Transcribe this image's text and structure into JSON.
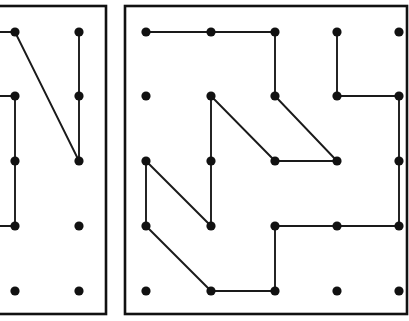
{
  "figure": {
    "canvas": {
      "width": 409,
      "height": 321
    },
    "background_color": "#ffffff",
    "peg_color": "#111111",
    "line_color": "#1a1a1a",
    "border_color": "#111111",
    "peg_radius": 4.6,
    "line_width": 1.9,
    "border_width": 2.6
  },
  "panels": [
    {
      "id": "left-panel",
      "label": "Left geoboard panel (cropped at left edge)",
      "frame": {
        "x": -40,
        "y": 6,
        "width": 146,
        "height": 308
      },
      "grid": {
        "columns_x": [
          15,
          79
        ],
        "rows_y": [
          32,
          96,
          161,
          226,
          291
        ],
        "spacing_x": 64,
        "spacing_y": 65
      },
      "pegs": [
        {
          "id": "L-c1-r1",
          "x": 15,
          "y": 32
        },
        {
          "id": "L-c2-r1",
          "x": 79,
          "y": 32
        },
        {
          "id": "L-c1-r2",
          "x": 15,
          "y": 96
        },
        {
          "id": "L-c2-r2",
          "x": 79,
          "y": 96
        },
        {
          "id": "L-c1-r3",
          "x": 15,
          "y": 161
        },
        {
          "id": "L-c2-r3",
          "x": 79,
          "y": 161
        },
        {
          "id": "L-c1-r4",
          "x": 15,
          "y": 226
        },
        {
          "id": "L-c2-r4",
          "x": 79,
          "y": 226
        },
        {
          "id": "L-c1-r5",
          "x": 15,
          "y": 291
        },
        {
          "id": "L-c2-r5",
          "x": 79,
          "y": 291
        }
      ],
      "segments": [
        {
          "id": "L-s1",
          "x1": -8,
          "y1": 32,
          "x2": 15,
          "y2": 32,
          "kind": "horizontal-clipped"
        },
        {
          "id": "L-s2",
          "x1": 15,
          "y1": 32,
          "x2": 79,
          "y2": 161,
          "kind": "diagonal"
        },
        {
          "id": "L-s3",
          "x1": 79,
          "y1": 32,
          "x2": 79,
          "y2": 161,
          "kind": "vertical"
        },
        {
          "id": "L-s4",
          "x1": -8,
          "y1": 96,
          "x2": 15,
          "y2": 96,
          "kind": "horizontal-clipped"
        },
        {
          "id": "L-s5",
          "x1": 15,
          "y1": 96,
          "x2": 15,
          "y2": 226,
          "kind": "vertical"
        },
        {
          "id": "L-s6",
          "x1": -8,
          "y1": 226,
          "x2": 15,
          "y2": 226,
          "kind": "horizontal-clipped"
        }
      ]
    },
    {
      "id": "right-panel",
      "label": "Right geoboard panel",
      "frame": {
        "x": 125,
        "y": 6,
        "width": 282,
        "height": 308
      },
      "grid": {
        "columns_x": [
          146,
          211,
          275,
          337,
          399
        ],
        "rows_y": [
          32,
          96,
          161,
          226,
          291
        ],
        "spacing_x": 64,
        "spacing_y": 65
      },
      "pegs": [
        {
          "id": "R-c1-r1",
          "x": 146,
          "y": 32
        },
        {
          "id": "R-c2-r1",
          "x": 211,
          "y": 32
        },
        {
          "id": "R-c3-r1",
          "x": 275,
          "y": 32
        },
        {
          "id": "R-c4-r1",
          "x": 337,
          "y": 32
        },
        {
          "id": "R-c5-r1",
          "x": 399,
          "y": 32
        },
        {
          "id": "R-c1-r2",
          "x": 146,
          "y": 96
        },
        {
          "id": "R-c2-r2",
          "x": 211,
          "y": 96
        },
        {
          "id": "R-c3-r2",
          "x": 275,
          "y": 96
        },
        {
          "id": "R-c4-r2",
          "x": 337,
          "y": 96
        },
        {
          "id": "R-c5-r2",
          "x": 399,
          "y": 96
        },
        {
          "id": "R-c1-r3",
          "x": 146,
          "y": 161
        },
        {
          "id": "R-c2-r3",
          "x": 211,
          "y": 161
        },
        {
          "id": "R-c3-r3",
          "x": 275,
          "y": 161
        },
        {
          "id": "R-c4-r3",
          "x": 337,
          "y": 161
        },
        {
          "id": "R-c5-r3",
          "x": 399,
          "y": 161
        },
        {
          "id": "R-c1-r4",
          "x": 146,
          "y": 226
        },
        {
          "id": "R-c2-r4",
          "x": 211,
          "y": 226
        },
        {
          "id": "R-c3-r4",
          "x": 275,
          "y": 226
        },
        {
          "id": "R-c4-r4",
          "x": 337,
          "y": 226
        },
        {
          "id": "R-c5-r4",
          "x": 399,
          "y": 226
        },
        {
          "id": "R-c1-r5",
          "x": 146,
          "y": 291
        },
        {
          "id": "R-c2-r5",
          "x": 211,
          "y": 291
        },
        {
          "id": "R-c3-r5",
          "x": 275,
          "y": 291
        },
        {
          "id": "R-c4-r5",
          "x": 337,
          "y": 291
        },
        {
          "id": "R-c5-r5",
          "x": 399,
          "y": 291
        }
      ],
      "segments": [
        {
          "id": "R-s1",
          "x1": 146,
          "y1": 32,
          "x2": 211,
          "y2": 32,
          "kind": "horizontal"
        },
        {
          "id": "R-s2",
          "x1": 211,
          "y1": 32,
          "x2": 275,
          "y2": 32,
          "kind": "horizontal"
        },
        {
          "id": "R-s3",
          "x1": 275,
          "y1": 32,
          "x2": 275,
          "y2": 96,
          "kind": "vertical"
        },
        {
          "id": "R-s4",
          "x1": 337,
          "y1": 32,
          "x2": 337,
          "y2": 96,
          "kind": "vertical"
        },
        {
          "id": "R-s5",
          "x1": 337,
          "y1": 96,
          "x2": 399,
          "y2": 96,
          "kind": "horizontal"
        },
        {
          "id": "R-s6",
          "x1": 399,
          "y1": 96,
          "x2": 399,
          "y2": 161,
          "kind": "vertical"
        },
        {
          "id": "R-s7",
          "x1": 211,
          "y1": 96,
          "x2": 211,
          "y2": 161,
          "kind": "vertical"
        },
        {
          "id": "R-s8",
          "x1": 211,
          "y1": 96,
          "x2": 275,
          "y2": 161,
          "kind": "diagonal"
        },
        {
          "id": "R-s9",
          "x1": 275,
          "y1": 96,
          "x2": 337,
          "y2": 161,
          "kind": "diagonal"
        },
        {
          "id": "R-s10",
          "x1": 275,
          "y1": 161,
          "x2": 337,
          "y2": 161,
          "kind": "horizontal"
        },
        {
          "id": "R-s11",
          "x1": 146,
          "y1": 161,
          "x2": 146,
          "y2": 226,
          "kind": "vertical"
        },
        {
          "id": "R-s12",
          "x1": 146,
          "y1": 161,
          "x2": 211,
          "y2": 226,
          "kind": "diagonal"
        },
        {
          "id": "R-s13",
          "x1": 211,
          "y1": 161,
          "x2": 211,
          "y2": 226,
          "kind": "vertical"
        },
        {
          "id": "R-s14",
          "x1": 146,
          "y1": 226,
          "x2": 211,
          "y2": 291,
          "kind": "diagonal"
        },
        {
          "id": "R-s15",
          "x1": 211,
          "y1": 291,
          "x2": 275,
          "y2": 291,
          "kind": "horizontal"
        },
        {
          "id": "R-s16",
          "x1": 275,
          "y1": 226,
          "x2": 275,
          "y2": 291,
          "kind": "vertical"
        },
        {
          "id": "R-s17",
          "x1": 275,
          "y1": 226,
          "x2": 337,
          "y2": 226,
          "kind": "horizontal"
        },
        {
          "id": "R-s18",
          "x1": 337,
          "y1": 226,
          "x2": 399,
          "y2": 226,
          "kind": "horizontal"
        },
        {
          "id": "R-s19",
          "x1": 399,
          "y1": 161,
          "x2": 399,
          "y2": 226,
          "kind": "vertical"
        }
      ]
    }
  ]
}
